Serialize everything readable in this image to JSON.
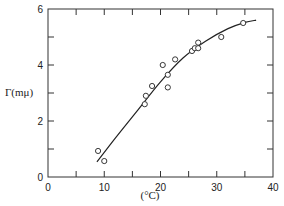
{
  "chart_data": {
    "type": "scatter",
    "title": "",
    "xlabel": "(°C)",
    "ylabel": "Γ(mμ)",
    "xlim": [
      0,
      40
    ],
    "ylim": [
      0,
      6
    ],
    "xticks": [
      0,
      10,
      20,
      30,
      40
    ],
    "xtick_labels": [
      "0",
      "10",
      "20",
      "30",
      "40"
    ],
    "yticks": [
      0,
      2,
      4,
      6
    ],
    "ytick_labels": [
      "0",
      "2",
      "4",
      "6"
    ],
    "minor_xticks": [
      5,
      15,
      25,
      35
    ],
    "minor_yticks": [
      1,
      3,
      5
    ],
    "grid": false,
    "legend": null,
    "series": [
      {
        "name": "measured",
        "marker": "open-circle",
        "points": [
          {
            "x": 8.9,
            "y": 0.93
          },
          {
            "x": 10.0,
            "y": 0.57
          },
          {
            "x": 17.2,
            "y": 2.6
          },
          {
            "x": 17.4,
            "y": 2.9
          },
          {
            "x": 18.5,
            "y": 3.25
          },
          {
            "x": 20.4,
            "y": 4.0
          },
          {
            "x": 21.3,
            "y": 3.2
          },
          {
            "x": 21.3,
            "y": 3.65
          },
          {
            "x": 22.6,
            "y": 4.2
          },
          {
            "x": 25.6,
            "y": 4.5
          },
          {
            "x": 26.1,
            "y": 4.6
          },
          {
            "x": 26.7,
            "y": 4.6
          },
          {
            "x": 26.7,
            "y": 4.8
          },
          {
            "x": 30.8,
            "y": 5.0
          },
          {
            "x": 34.7,
            "y": 5.5
          }
        ]
      },
      {
        "name": "fitted curve",
        "marker": "line",
        "points": [
          {
            "x": 8.7,
            "y": 0.54
          },
          {
            "x": 12,
            "y": 1.4
          },
          {
            "x": 16,
            "y": 2.4
          },
          {
            "x": 20,
            "y": 3.4
          },
          {
            "x": 24,
            "y": 4.25
          },
          {
            "x": 28,
            "y": 4.85
          },
          {
            "x": 32,
            "y": 5.3
          },
          {
            "x": 35,
            "y": 5.52
          },
          {
            "x": 37,
            "y": 5.6
          }
        ]
      }
    ]
  }
}
